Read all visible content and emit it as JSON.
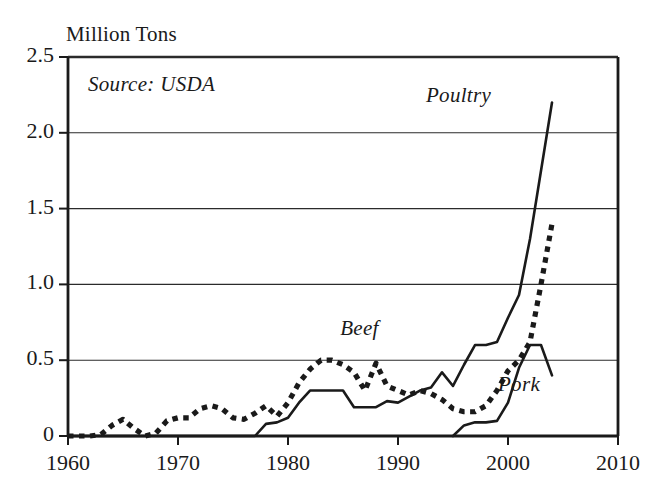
{
  "chart_data": {
    "type": "line",
    "title": "",
    "ylabel": "Million Tons",
    "xlabel": "",
    "annotation_source": "Source: USDA",
    "xlim": [
      1960,
      2010
    ],
    "ylim": [
      0,
      2.5
    ],
    "grid": true,
    "legend_position": "inline-labels",
    "xticks": [
      1960,
      1970,
      1980,
      1990,
      2000,
      2010
    ],
    "xtick_labels": [
      "1960",
      "1970",
      "1980",
      "1990",
      "2000",
      "2010"
    ],
    "yticks": [
      0,
      0.5,
      1.0,
      1.5,
      2.0,
      2.5
    ],
    "ytick_labels": [
      "0",
      "0.5",
      "1.0",
      "1.5",
      "2.0",
      "2.5"
    ],
    "series": [
      {
        "name": "Poultry",
        "style": "solid",
        "label_x": 1995.5,
        "label_y": 2.16,
        "x": [
          1960,
          1977,
          1978,
          1979,
          1980,
          1981,
          1982,
          1983,
          1984,
          1985,
          1986,
          1987,
          1988,
          1989,
          1990,
          1991,
          1992,
          1993,
          1994,
          1995,
          1996,
          1997,
          1998,
          1999,
          2000,
          2001,
          2002,
          2003,
          2004
        ],
        "y": [
          0.0,
          0.0,
          0.08,
          0.09,
          0.12,
          0.22,
          0.3,
          0.3,
          0.3,
          0.3,
          0.19,
          0.19,
          0.19,
          0.23,
          0.22,
          0.26,
          0.3,
          0.32,
          0.42,
          0.33,
          0.47,
          0.6,
          0.6,
          0.62,
          0.78,
          0.93,
          1.3,
          1.75,
          2.2
        ]
      },
      {
        "name": "Beef",
        "style": "dotted",
        "label_x": 1986.5,
        "label_y": 0.62,
        "x": [
          1960,
          1961,
          1962,
          1963,
          1964,
          1965,
          1966,
          1967,
          1968,
          1969,
          1970,
          1971,
          1972,
          1973,
          1974,
          1975,
          1976,
          1977,
          1978,
          1979,
          1980,
          1981,
          1982,
          1983,
          1984,
          1985,
          1986,
          1987,
          1988,
          1989,
          1990,
          1991,
          1992,
          1993,
          1994,
          1995,
          1996,
          1997,
          1998,
          1999,
          2000,
          2001,
          2002,
          2003,
          2004
        ],
        "y": [
          0.0,
          0.0,
          0.0,
          0.01,
          0.07,
          0.11,
          0.05,
          0.0,
          0.02,
          0.1,
          0.12,
          0.12,
          0.18,
          0.2,
          0.18,
          0.12,
          0.11,
          0.15,
          0.2,
          0.13,
          0.22,
          0.35,
          0.44,
          0.5,
          0.5,
          0.47,
          0.42,
          0.3,
          0.48,
          0.33,
          0.3,
          0.27,
          0.3,
          0.28,
          0.24,
          0.18,
          0.16,
          0.16,
          0.2,
          0.3,
          0.43,
          0.5,
          0.62,
          1.0,
          1.4
        ]
      },
      {
        "name": "Pork",
        "style": "solid",
        "label_x": 2001.0,
        "label_y": 0.25,
        "x": [
          1995,
          1996,
          1997,
          1998,
          1999,
          2000,
          2001,
          2002,
          2003,
          2004
        ],
        "y": [
          0.0,
          0.07,
          0.09,
          0.09,
          0.1,
          0.22,
          0.45,
          0.6,
          0.6,
          0.4
        ]
      }
    ]
  },
  "colors": {
    "ink": "#1a1a1a",
    "grid": "#2b2b2b",
    "background": "#ffffff"
  }
}
